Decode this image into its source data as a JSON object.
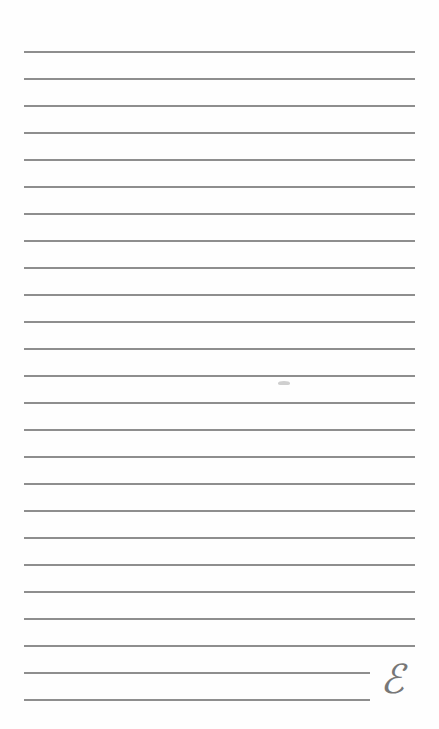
{
  "page": {
    "type": "lined-notepaper",
    "background_color": "#fefefe",
    "rule_color": "#8e8e8e",
    "rule_count": 25,
    "rules": [
      {
        "y": 51,
        "x1": 24,
        "x2": 415
      },
      {
        "y": 78,
        "x1": 24,
        "x2": 415
      },
      {
        "y": 105,
        "x1": 24,
        "x2": 415
      },
      {
        "y": 132,
        "x1": 24,
        "x2": 415
      },
      {
        "y": 159,
        "x1": 24,
        "x2": 415
      },
      {
        "y": 186,
        "x1": 24,
        "x2": 415
      },
      {
        "y": 213,
        "x1": 24,
        "x2": 415
      },
      {
        "y": 240,
        "x1": 24,
        "x2": 415
      },
      {
        "y": 267,
        "x1": 24,
        "x2": 415
      },
      {
        "y": 294,
        "x1": 24,
        "x2": 415
      },
      {
        "y": 321,
        "x1": 24,
        "x2": 415
      },
      {
        "y": 348,
        "x1": 24,
        "x2": 415
      },
      {
        "y": 375,
        "x1": 24,
        "x2": 415
      },
      {
        "y": 402,
        "x1": 24,
        "x2": 415
      },
      {
        "y": 429,
        "x1": 24,
        "x2": 415
      },
      {
        "y": 456,
        "x1": 24,
        "x2": 415
      },
      {
        "y": 483,
        "x1": 24,
        "x2": 415
      },
      {
        "y": 510,
        "x1": 24,
        "x2": 415
      },
      {
        "y": 537,
        "x1": 24,
        "x2": 415
      },
      {
        "y": 564,
        "x1": 24,
        "x2": 415
      },
      {
        "y": 591,
        "x1": 24,
        "x2": 415
      },
      {
        "y": 618,
        "x1": 24,
        "x2": 415
      },
      {
        "y": 645,
        "x1": 24,
        "x2": 415
      },
      {
        "y": 672,
        "x1": 24,
        "x2": 370
      },
      {
        "y": 699,
        "x1": 24,
        "x2": 370
      }
    ],
    "monogram": {
      "glyph": "ℰ",
      "color": "#777777"
    }
  }
}
